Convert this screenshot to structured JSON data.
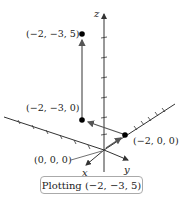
{
  "figure": {
    "axes": {
      "x_label": "x",
      "y_label": "y",
      "z_label": "z"
    },
    "points": [
      {
        "label": "(−2, −3, 5)",
        "coords": [
          -2,
          -3,
          5
        ]
      },
      {
        "label": "(−2, −3, 0)",
        "coords": [
          -2,
          -3,
          0
        ]
      },
      {
        "label": "(−2, 0, 0)",
        "coords": [
          -2,
          0,
          0
        ]
      },
      {
        "label": "(0, 0, 0)",
        "coords": [
          0,
          0,
          0
        ]
      }
    ],
    "caption": "Plotting (−2, −3, 5)",
    "colors": {
      "axis": "#333333",
      "point": "#000000",
      "path_arrow": "#555555",
      "caption_border": "#aaaaaa"
    }
  }
}
